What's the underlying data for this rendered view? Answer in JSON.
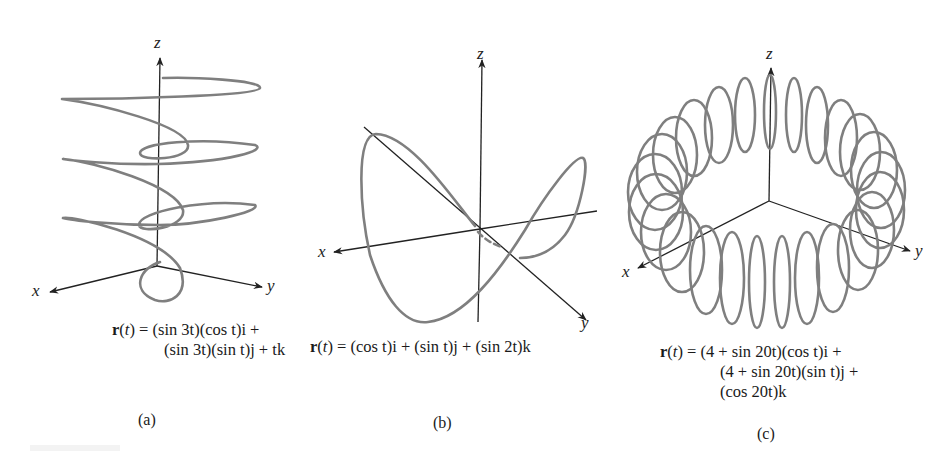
{
  "figure": {
    "panels": [
      {
        "id": "a",
        "caption": "(a)",
        "axes": {
          "x": "x",
          "y": "y",
          "z": "z"
        },
        "equation_line1": "(sin 3t)(cos t)i +",
        "equation_prefix": "r(t) = ",
        "equation_lines": [
          "(sin 3t)(cos t)i +",
          "(sin 3t)(sin t)j + tk"
        ],
        "description": "Helical curve winding around the z-axis"
      },
      {
        "id": "b",
        "caption": "(b)",
        "axes": {
          "x": "x",
          "y": "y",
          "z": "z"
        },
        "equation_prefix": "r(t) = ",
        "equation_lines": [
          "(cos t)i + (sin t)j + (sin 2t)k"
        ],
        "description": "Saddle-shaped closed curve on the unit cylinder"
      },
      {
        "id": "c",
        "caption": "(c)",
        "axes": {
          "x": "x",
          "y": "y",
          "z": "z"
        },
        "equation_prefix": "r(t) = ",
        "equation_lines": [
          "(4 + sin 20t)(cos t)i +",
          "(4 + sin 20t)(sin t)j +",
          "(cos 20t)k"
        ],
        "description": "Toroidal spiral wrapped around a torus"
      }
    ],
    "colors": {
      "curve": "#7f7f7f",
      "axis": "#222222",
      "text": "#1a1a1a"
    }
  }
}
